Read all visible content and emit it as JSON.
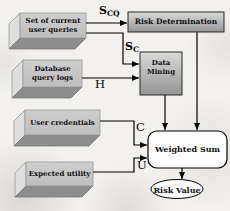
{
  "diagram_type": "flowchart",
  "nodes": {
    "user_queries": {
      "label": "Set of current user queries",
      "shape": "3d-box"
    },
    "database_logs": {
      "label": "Database query logs",
      "shape": "3d-box"
    },
    "user_credentials": {
      "label": "User credentials",
      "shape": "3d-box"
    },
    "expected_utility": {
      "label": "Expected utility",
      "shape": "3d-box"
    },
    "risk_determination": {
      "label": "Risk Determination",
      "shape": "gradient-rect"
    },
    "data_mining": {
      "label": "Data Mining",
      "shape": "gradient-rect"
    },
    "weighted_sum": {
      "label": "Weighted Sum",
      "shape": "rounded-rect"
    },
    "risk_value": {
      "label": "Risk Value",
      "shape": "ellipse"
    }
  },
  "edge_labels": {
    "scq": {
      "base": "S",
      "sub": "CQ"
    },
    "sc": {
      "base": "S",
      "sub": "C"
    },
    "h": "H",
    "c": "C",
    "u": "U"
  },
  "edges": [
    {
      "from": "user_queries",
      "to": "risk_determination",
      "label": "S_CQ"
    },
    {
      "from": "user_queries",
      "to": "data_mining",
      "label": "S_C"
    },
    {
      "from": "database_logs",
      "to": "data_mining",
      "label": "H"
    },
    {
      "from": "data_mining",
      "to": "weighted_sum",
      "label": ""
    },
    {
      "from": "risk_determination",
      "to": "weighted_sum",
      "label": ""
    },
    {
      "from": "user_credentials",
      "to": "weighted_sum",
      "label": "C"
    },
    {
      "from": "expected_utility",
      "to": "weighted_sum",
      "label": "U"
    },
    {
      "from": "weighted_sum",
      "to": "risk_value",
      "label": ""
    }
  ],
  "colors": {
    "background": "#f3f1ee",
    "box_front": "#c8c8c8",
    "box_side": "#dedede",
    "box_bottom": "#8d8d8d",
    "gradient_top": "#dadada",
    "gradient_bottom": "#949494",
    "node_fill": "#fdfdfd",
    "line": "#000000"
  }
}
